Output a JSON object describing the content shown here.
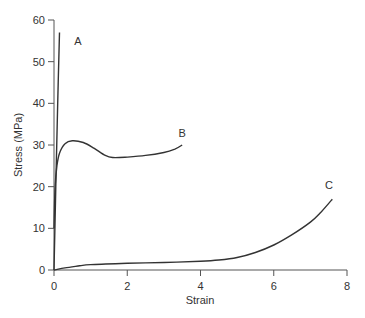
{
  "chart_data": {
    "type": "line",
    "title": "",
    "xlabel": "Strain",
    "ylabel": "Stress (MPa)",
    "xlim": [
      0,
      8
    ],
    "ylim": [
      0,
      60
    ],
    "xticks": [
      0,
      2,
      4,
      6,
      8
    ],
    "yticks": [
      0,
      10,
      20,
      30,
      40,
      50,
      60
    ],
    "grid": false,
    "legend": "none (curves labelled inline)",
    "series": [
      {
        "name": "A",
        "label_pos": {
          "x": 0.55,
          "y": 55
        },
        "x": [
          0,
          0.05,
          0.1,
          0.15
        ],
        "y": [
          0,
          20,
          40,
          57
        ]
      },
      {
        "name": "B",
        "label_pos": {
          "x": 3.4,
          "y": 33
        },
        "x": [
          0,
          0.03,
          0.08,
          0.15,
          0.3,
          0.5,
          0.8,
          1.1,
          1.4,
          1.6,
          2.0,
          2.5,
          3.0,
          3.3,
          3.5
        ],
        "y": [
          10,
          20,
          25,
          28,
          30.3,
          31,
          30.6,
          29.2,
          27.5,
          27,
          27.1,
          27.5,
          28.2,
          29,
          30
        ]
      },
      {
        "name": "C",
        "label_pos": {
          "x": 7.4,
          "y": 20.5
        },
        "x": [
          0,
          0.3,
          0.7,
          1.0,
          2.0,
          3.0,
          4.0,
          4.5,
          5.0,
          5.5,
          6.0,
          6.5,
          7.0,
          7.3,
          7.6
        ],
        "y": [
          0,
          0.5,
          1.0,
          1.3,
          1.6,
          1.8,
          2.1,
          2.4,
          3.0,
          4.2,
          6.0,
          8.5,
          11.5,
          14,
          17
        ]
      }
    ]
  },
  "axes": {
    "x_label": "Strain",
    "y_label": "Stress (MPa)"
  }
}
